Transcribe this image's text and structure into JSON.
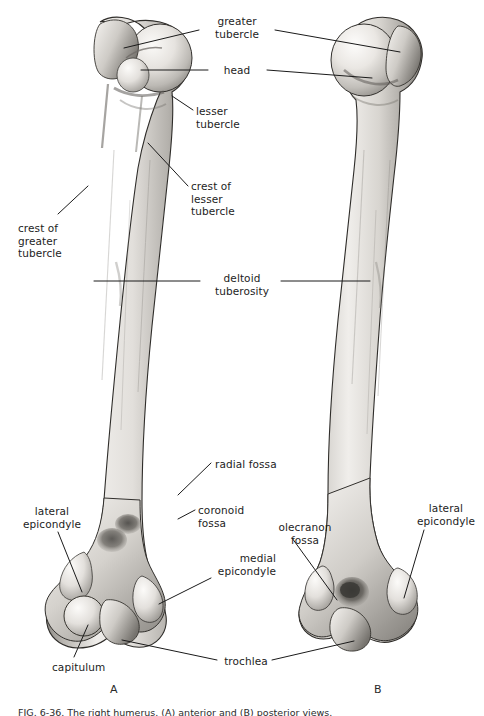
{
  "figure": {
    "panel_letters": [
      {
        "letter": "A",
        "x": 110,
        "y": 683
      },
      {
        "letter": "B",
        "x": 374,
        "y": 683
      }
    ],
    "caption": "FIG. 6-36.  The right humerus. (A) anterior and (B) posterior views."
  },
  "labels": [
    {
      "id": "greater-tubercle",
      "text": "greater\ntubercle",
      "align": "c",
      "x": 202,
      "y": 15,
      "width": 70
    },
    {
      "id": "head",
      "text": "head",
      "align": "c",
      "x": 212,
      "y": 64,
      "width": 50
    },
    {
      "id": "lesser-tubercle",
      "text": "lesser\ntubercle",
      "align": "l",
      "x": 196,
      "y": 105,
      "width": 70
    },
    {
      "id": "crest-of-lesser-tubercle",
      "text": "crest of\nlesser\ntubercle",
      "align": "l",
      "x": 191,
      "y": 180,
      "width": 70
    },
    {
      "id": "crest-of-greater-tubercle",
      "text": "crest of\ngreater\ntubercle",
      "align": "l",
      "x": 18,
      "y": 222,
      "width": 72
    },
    {
      "id": "deltoid-tuberosity",
      "text": "deltoid\ntuberosity",
      "align": "c",
      "x": 205,
      "y": 272,
      "width": 74
    },
    {
      "id": "radial-fossa",
      "text": "radial fossa",
      "align": "l",
      "x": 215,
      "y": 458,
      "width": 80
    },
    {
      "id": "coronoid-fossa",
      "text": "coronoid\nfossa",
      "align": "l",
      "x": 198,
      "y": 504,
      "width": 70
    },
    {
      "id": "lateral-epicondyle-a",
      "text": "lateral\nepicondyle",
      "align": "c",
      "x": 16,
      "y": 505,
      "width": 72
    },
    {
      "id": "olecranon-fossa",
      "text": "olecranon\nfossa",
      "align": "c",
      "x": 269,
      "y": 521,
      "width": 72
    },
    {
      "id": "medial-epicondyle",
      "text": "medial\nepicondyle",
      "align": "r",
      "x": 204,
      "y": 552,
      "width": 72
    },
    {
      "id": "lateral-epicondyle-b",
      "text": "lateral\nepicondyle",
      "align": "c",
      "x": 410,
      "y": 502,
      "width": 72
    },
    {
      "id": "capitulum",
      "text": "capitulum",
      "align": "l",
      "x": 52,
      "y": 661,
      "width": 70
    },
    {
      "id": "trochlea",
      "text": "trochlea",
      "align": "c",
      "x": 220,
      "y": 655,
      "width": 52
    }
  ],
  "leader_lines": [
    {
      "id": "greater-tubercle-left",
      "points": "199,30 124,48"
    },
    {
      "id": "greater-tubercle-right",
      "points": "275,30 400,52"
    },
    {
      "id": "head-left",
      "points": "208,70 141,70"
    },
    {
      "id": "head-right",
      "points": "267,70 372,78"
    },
    {
      "id": "lesser-tubercle-leader",
      "points": "193,110 172,96"
    },
    {
      "id": "crest-lesser-tubercle-leader",
      "points": "188,186 148,143"
    },
    {
      "id": "crest-greater-tubercle-leader",
      "points": "58,214 88,186"
    },
    {
      "id": "deltoid-left",
      "points": "200,281 94,281"
    },
    {
      "id": "deltoid-right",
      "points": "281,281 370,281"
    },
    {
      "id": "radial-fossa-leader",
      "points": "211,463 178,495"
    },
    {
      "id": "coronoid-fossa-leader",
      "points": "195,510 178,519"
    },
    {
      "id": "lateral-epicondyle-a-leader",
      "points": "58,532 82,592"
    },
    {
      "id": "olecranon-fossa-leader",
      "points": "292,538 337,600"
    },
    {
      "id": "medial-epicondyle-leader",
      "points": "211,578 159,604"
    },
    {
      "id": "lateral-epicondyle-b-leader",
      "points": "424,530 404,598"
    },
    {
      "id": "capitulum-leader",
      "points": "74,657 88,625"
    },
    {
      "id": "trochlea-left",
      "points": "217,660 122,640"
    },
    {
      "id": "trochlea-right",
      "points": "272,660 354,641"
    }
  ],
  "bones": [
    {
      "id": "humerus-anterior",
      "view": "anterior",
      "panel": "A"
    },
    {
      "id": "humerus-posterior",
      "view": "posterior",
      "panel": "B"
    }
  ],
  "colors": {
    "bone_light": "#f2f0ed",
    "bone_mid": "#c9c6c1",
    "bone_shadow": "#7c7974",
    "bone_dark": "#4d4b47",
    "outline": "#2b2b2b",
    "leader": "#1a1a1a",
    "background": "#ffffff",
    "text": "#1d1d1d"
  }
}
